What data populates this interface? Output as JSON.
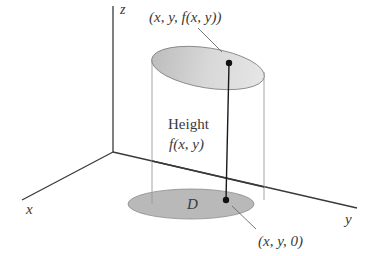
{
  "diagram": {
    "axes": {
      "z_label": "z",
      "x_label": "x",
      "y_label": "y"
    },
    "labels": {
      "top_point": "(x, y, f(x, y))",
      "height_title": "Height",
      "height_expr": "f(x, y)",
      "region": "D",
      "bottom_point": "(x, y, 0)"
    },
    "colors": {
      "axis": "#3a3a3a",
      "cylinder_edge": "#8a8a8a",
      "top_ellipse_fill": "#d6d6d6",
      "bottom_ellipse_fill": "#b9b9b9",
      "point": "#111111"
    }
  }
}
